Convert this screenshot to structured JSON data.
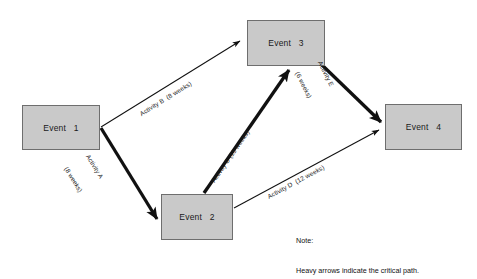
{
  "diagram": {
    "background_color": "#ffffff",
    "node_fill_color": "#c9c9c9",
    "node_border_color": "#6e6e6e",
    "arrow_color": "#111111",
    "nodes": [
      {
        "id": "event-1",
        "label": "Event   1",
        "x": 22,
        "y": 105,
        "width": 78,
        "height": 45
      },
      {
        "id": "event-2",
        "label": "Event   2",
        "x": 161,
        "y": 194,
        "width": 72,
        "height": 46
      },
      {
        "id": "event-3",
        "label": "Event   3",
        "x": 247,
        "y": 20,
        "width": 78,
        "height": 46
      },
      {
        "id": "event-4",
        "label": "Event   4",
        "x": 385,
        "y": 104,
        "width": 77,
        "height": 46
      }
    ],
    "edges": [
      {
        "id": "activity-a",
        "activity": "Activity A",
        "duration": "(8 weeks)",
        "label_lines": [
          "Activity A",
          "(8 weeks)"
        ],
        "from": "event-1",
        "to": "event-2",
        "critical": true,
        "weight": "heavy"
      },
      {
        "id": "activity-b",
        "activity": "Activity B",
        "duration": "(8 weeks)",
        "label_lines": [
          "Activity B  (8 weeks)"
        ],
        "from": "event-1",
        "to": "event-3",
        "critical": false,
        "weight": "thin"
      },
      {
        "id": "activity-c",
        "activity": "Activity C",
        "duration": "(15 weeks)",
        "label_lines": [
          "Activity C (15 weeks)"
        ],
        "from": "event-2",
        "to": "event-3",
        "critical": true,
        "weight": "heavy"
      },
      {
        "id": "activity-d",
        "activity": "Activity D",
        "duration": "(12 weeks)",
        "label_lines": [
          "Activity D  (12 weeks)"
        ],
        "from": "event-2",
        "to": "event-4",
        "critical": false,
        "weight": "thin"
      },
      {
        "id": "activity-e",
        "activity": "Activity E",
        "duration": "(6 weeks)",
        "label_lines": [
          "Activity E",
          "(6 weeks)"
        ],
        "from": "event-3",
        "to": "event-4",
        "critical": true,
        "weight": "heavy"
      }
    ],
    "note": {
      "heading": "Note:",
      "text": "Heavy arrows indicate the critical path."
    }
  }
}
